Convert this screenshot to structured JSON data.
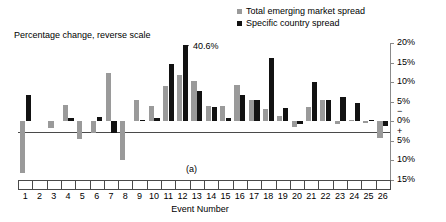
{
  "chart_data": {
    "type": "bar",
    "title": "",
    "ylabel": "Percentage change, reverse scale",
    "xlabel": "Event Number",
    "panel_label": "(a)",
    "reverse_scale": true,
    "grid": false,
    "legend_position": "top-right",
    "ylim": [
      20,
      -15
    ],
    "yaxis_side": "right",
    "ytick_labels": [
      "20%",
      "15%",
      "10%",
      "5%",
      "0%",
      "5%",
      "10%",
      "15%"
    ],
    "ytick_values": [
      20,
      15,
      10,
      5,
      0,
      -5,
      -10,
      -15
    ],
    "sign_markers": [
      "−",
      "+"
    ],
    "categories": [
      "1",
      "2",
      "3",
      "4",
      "5",
      "6",
      "7",
      "8",
      "9",
      "10",
      "11",
      "12",
      "13",
      "14",
      "15",
      "16",
      "17",
      "18",
      "19",
      "20",
      "21",
      "22",
      "23",
      "24",
      "25",
      "26"
    ],
    "series": [
      {
        "name": "Total emerging market spread",
        "color": "#9a9a9a",
        "values": [
          -13.3,
          0,
          -1.6,
          4.1,
          -4.5,
          -2.9,
          12.4,
          -9.8,
          5.4,
          3.8,
          9.0,
          11.9,
          10.4,
          3.8,
          3.8,
          9.4,
          5.5,
          3.1,
          1.4,
          -1.5,
          3.6,
          5.4,
          -0.8,
          0.3,
          -0.4,
          -4.2
        ]
      },
      {
        "name": "Specific country spread",
        "color": "#121212",
        "values": [
          6.6,
          0,
          0,
          0.8,
          0,
          1.2,
          -3.1,
          0,
          0.2,
          0.9,
          14.6,
          40.6,
          7.7,
          3.7,
          0.8,
          6.7,
          5.5,
          16.3,
          3.3,
          -0.8,
          10.1,
          5.4,
          6.1,
          4.8,
          0.3,
          -1.3
        ]
      }
    ],
    "annotations": [
      {
        "text": "40.6%",
        "category": "12",
        "series": "Specific country spread",
        "note": "bar clipped, broken-bar arrow marker"
      }
    ]
  },
  "legend": {
    "items": [
      {
        "label": "Total emerging market spread",
        "swatch": "total"
      },
      {
        "label": "Specific country spread",
        "swatch": "specific"
      }
    ]
  }
}
